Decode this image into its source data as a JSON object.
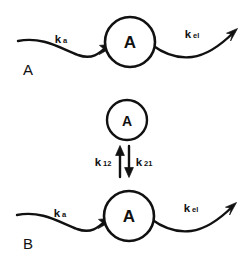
{
  "figure": {
    "title": "",
    "background_color": "#ffffff",
    "ink_color": "#111111",
    "width": 248,
    "height": 264
  },
  "panels": [
    {
      "id": "panel-a",
      "label": "A",
      "description": "one-compartment model",
      "compartment": {
        "label": "A"
      },
      "arrows": [
        {
          "id": "absorption",
          "label": "k",
          "subscript": "a",
          "direction": "into-compartment"
        },
        {
          "id": "elimination",
          "label": "k",
          "subscript": "el",
          "direction": "out-of-compartment"
        }
      ]
    },
    {
      "id": "panel-b",
      "label": "B",
      "description": "two-compartment model",
      "peripheral_compartment": {
        "label": "A"
      },
      "central_compartment": {
        "label": "A"
      },
      "transfer_arrows": [
        {
          "id": "k12",
          "label": "k",
          "subscript": "12",
          "direction": "up"
        },
        {
          "id": "k21",
          "label": "k",
          "subscript": "21",
          "direction": "down"
        }
      ],
      "arrows": [
        {
          "id": "absorption",
          "label": "k",
          "subscript": "a",
          "direction": "into-compartment"
        },
        {
          "id": "elimination",
          "label": "k",
          "subscript": "el",
          "direction": "out-of-compartment"
        }
      ]
    }
  ]
}
